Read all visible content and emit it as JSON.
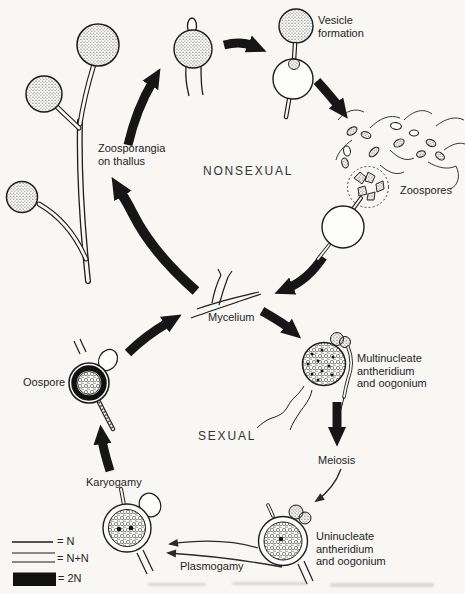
{
  "figure": {
    "type": "life-cycle-diagram",
    "colors": {
      "ink": "#1b1b1b",
      "paper": "#f8f7f4"
    },
    "section_labels": {
      "nonsexual": "NONSEXUAL",
      "sexual": "SEXUAL"
    },
    "stage_labels": {
      "zoosporangia_line1": "Zoosporangia",
      "zoosporangia_line2": "on thallus",
      "vesicle_line1": "Vesicle",
      "vesicle_line2": "formation",
      "zoospores": "Zoospores",
      "mycelium": "Mycelium",
      "multinucleate_line1": "Multinucleate",
      "multinucleate_line2": "antheridium",
      "multinucleate_line3": "and oogonium",
      "meiosis": "Meiosis",
      "uninucleate_line1": "Uninucleate",
      "uninucleate_line2": "antheridium",
      "uninucleate_line3": "and oogonium",
      "plasmogamy": "Plasmogamy",
      "karyogamy": "Karyogamy",
      "oospore": "Oospore"
    },
    "legend": {
      "items": [
        {
          "symbol": "single-line",
          "label": "= N"
        },
        {
          "symbol": "double-line",
          "label": "= N+N"
        },
        {
          "symbol": "filled-bar",
          "label": "= 2N"
        }
      ]
    }
  }
}
